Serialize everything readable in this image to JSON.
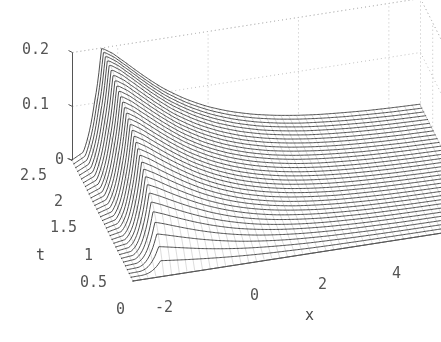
{
  "figure": {
    "kind": "3d-mesh-surface",
    "background": "#ffffff",
    "mesh_color": "#3c3c3c",
    "grid_color": "#bfbfbf",
    "axis_color": "#555555",
    "tick_font_px": 15
  },
  "axes": {
    "x": {
      "label": "x",
      "ticks": [
        "-2",
        "0",
        "2",
        "4"
      ],
      "tick_values": [
        -2,
        0,
        2,
        4
      ],
      "range": [
        -3.0,
        4.7
      ]
    },
    "t": {
      "label": "t",
      "ticks": [
        "0",
        "0.5",
        "1",
        "1.5",
        "2",
        "2.5"
      ],
      "tick_values": [
        0,
        0.5,
        1,
        1.5,
        2,
        2.5
      ],
      "range": [
        0,
        2.5
      ]
    },
    "z": {
      "label": "",
      "ticks": [
        "0",
        "0.1",
        "0.2"
      ],
      "tick_values": [
        0,
        0.1,
        0.2
      ],
      "range": [
        0,
        0.2
      ]
    }
  },
  "chart_data": {
    "type": "line",
    "title": "",
    "xlabel": "x",
    "ylabel": "t",
    "zlabel": "",
    "grid": true,
    "legend": null,
    "xlim": [
      -3.0,
      4.7
    ],
    "ylim": [
      0,
      2.5
    ],
    "zlim": [
      0,
      0.2
    ],
    "xticks": [
      -2,
      0,
      2,
      4
    ],
    "yticks": [
      0,
      0.5,
      1,
      1.5,
      2,
      2.5
    ],
    "zticks": [
      0,
      0.1,
      0.2
    ],
    "surface": {
      "x": [
        -3.0,
        -2.75,
        -2.5,
        -2.3,
        -2.1,
        -1.8,
        -1.4,
        -1.0,
        -0.5,
        0.0,
        0.5,
        1.0,
        1.5,
        2.0,
        2.5,
        3.0,
        3.5,
        4.0,
        4.7
      ],
      "t": [
        0,
        0.078,
        0.156,
        0.234,
        0.313,
        0.391,
        0.469,
        0.547,
        0.625,
        0.703,
        0.781,
        0.859,
        0.938,
        1.016,
        1.094,
        1.172,
        1.25,
        1.328,
        1.406,
        1.484,
        1.563,
        1.641,
        1.719,
        1.797,
        1.875,
        1.953,
        2.031,
        2.109,
        2.188,
        2.266,
        2.344,
        2.422,
        2.5
      ],
      "series": [
        {
          "name": "t=0.000",
          "values": [
            0,
            0,
            0,
            0,
            0,
            0,
            0,
            0,
            0,
            0,
            0,
            0,
            0,
            0,
            0,
            0,
            0,
            0,
            0
          ]
        },
        {
          "name": "t=0.078",
          "values": [
            0,
            0.001,
            0.006,
            0.007,
            0.006,
            0.005,
            0.004,
            0.003,
            0.002,
            0.001,
            0.001,
            0,
            0,
            0,
            0,
            0,
            0,
            0,
            0
          ]
        },
        {
          "name": "t=0.156",
          "values": [
            0,
            0.002,
            0.012,
            0.014,
            0.013,
            0.011,
            0.008,
            0.006,
            0.004,
            0.003,
            0.002,
            0.001,
            0.001,
            0,
            0,
            0,
            0,
            0,
            0
          ]
        },
        {
          "name": "t=0.234",
          "values": [
            0,
            0.003,
            0.018,
            0.021,
            0.02,
            0.017,
            0.013,
            0.01,
            0.007,
            0.005,
            0.003,
            0.002,
            0.001,
            0.001,
            0,
            0,
            0,
            0,
            0
          ]
        },
        {
          "name": "t=0.313",
          "values": [
            0,
            0.004,
            0.024,
            0.028,
            0.027,
            0.023,
            0.018,
            0.014,
            0.01,
            0.007,
            0.005,
            0.003,
            0.002,
            0.001,
            0.001,
            0,
            0,
            0,
            0
          ]
        },
        {
          "name": "t=0.391",
          "values": [
            0,
            0.005,
            0.03,
            0.035,
            0.034,
            0.029,
            0.023,
            0.018,
            0.013,
            0.01,
            0.007,
            0.005,
            0.003,
            0.002,
            0.001,
            0.001,
            0,
            0,
            0
          ]
        },
        {
          "name": "t=0.469",
          "values": [
            0,
            0.006,
            0.036,
            0.042,
            0.041,
            0.035,
            0.028,
            0.022,
            0.017,
            0.012,
            0.009,
            0.006,
            0.004,
            0.003,
            0.002,
            0.001,
            0.001,
            0,
            0
          ]
        },
        {
          "name": "t=0.547",
          "values": [
            0,
            0.007,
            0.042,
            0.049,
            0.048,
            0.042,
            0.034,
            0.027,
            0.02,
            0.015,
            0.011,
            0.008,
            0.005,
            0.004,
            0.002,
            0.002,
            0.001,
            0.001,
            0
          ]
        },
        {
          "name": "t=0.625",
          "values": [
            0,
            0.008,
            0.048,
            0.056,
            0.055,
            0.048,
            0.039,
            0.031,
            0.024,
            0.018,
            0.013,
            0.01,
            0.007,
            0.005,
            0.003,
            0.002,
            0.001,
            0.001,
            0.001
          ]
        },
        {
          "name": "t=0.703",
          "values": [
            0,
            0.009,
            0.054,
            0.063,
            0.062,
            0.054,
            0.044,
            0.035,
            0.027,
            0.021,
            0.016,
            0.012,
            0.008,
            0.006,
            0.004,
            0.003,
            0.002,
            0.001,
            0.001
          ]
        },
        {
          "name": "t=0.781",
          "values": [
            0,
            0.01,
            0.06,
            0.07,
            0.069,
            0.061,
            0.05,
            0.04,
            0.031,
            0.024,
            0.018,
            0.013,
            0.01,
            0.007,
            0.005,
            0.003,
            0.002,
            0.002,
            0.001
          ]
        },
        {
          "name": "t=0.859",
          "values": [
            0,
            0.011,
            0.066,
            0.077,
            0.076,
            0.067,
            0.055,
            0.044,
            0.034,
            0.026,
            0.02,
            0.015,
            0.011,
            0.008,
            0.006,
            0.004,
            0.003,
            0.002,
            0.001
          ]
        },
        {
          "name": "t=0.938",
          "values": [
            0,
            0.012,
            0.072,
            0.084,
            0.083,
            0.073,
            0.061,
            0.049,
            0.038,
            0.029,
            0.022,
            0.017,
            0.013,
            0.009,
            0.007,
            0.005,
            0.003,
            0.002,
            0.001
          ]
        },
        {
          "name": "t=1.016",
          "values": [
            0,
            0.013,
            0.078,
            0.091,
            0.09,
            0.08,
            0.066,
            0.053,
            0.041,
            0.032,
            0.025,
            0.019,
            0.014,
            0.01,
            0.008,
            0.005,
            0.004,
            0.003,
            0.002
          ]
        },
        {
          "name": "t=1.094",
          "values": [
            0,
            0.014,
            0.084,
            0.098,
            0.097,
            0.086,
            0.072,
            0.058,
            0.045,
            0.035,
            0.027,
            0.02,
            0.015,
            0.011,
            0.008,
            0.006,
            0.004,
            0.003,
            0.002
          ]
        },
        {
          "name": "t=1.172",
          "values": [
            0,
            0.015,
            0.09,
            0.105,
            0.104,
            0.093,
            0.077,
            0.063,
            0.049,
            0.038,
            0.029,
            0.022,
            0.017,
            0.012,
            0.009,
            0.007,
            0.005,
            0.003,
            0.002
          ]
        },
        {
          "name": "t=1.250",
          "values": [
            0,
            0.016,
            0.096,
            0.112,
            0.111,
            0.099,
            0.083,
            0.067,
            0.053,
            0.041,
            0.032,
            0.024,
            0.018,
            0.014,
            0.01,
            0.007,
            0.005,
            0.004,
            0.002
          ]
        },
        {
          "name": "t=1.328",
          "values": [
            0,
            0.017,
            0.102,
            0.119,
            0.118,
            0.106,
            0.088,
            0.072,
            0.056,
            0.044,
            0.034,
            0.026,
            0.02,
            0.015,
            0.011,
            0.008,
            0.006,
            0.004,
            0.003
          ]
        },
        {
          "name": "t=1.406",
          "values": [
            0,
            0.018,
            0.108,
            0.126,
            0.125,
            0.112,
            0.094,
            0.076,
            0.06,
            0.047,
            0.036,
            0.028,
            0.021,
            0.016,
            0.012,
            0.009,
            0.006,
            0.004,
            0.003
          ]
        },
        {
          "name": "t=1.484",
          "values": [
            0,
            0.019,
            0.114,
            0.133,
            0.132,
            0.119,
            0.099,
            0.081,
            0.064,
            0.05,
            0.039,
            0.03,
            0.023,
            0.017,
            0.013,
            0.009,
            0.007,
            0.005,
            0.003
          ]
        },
        {
          "name": "t=1.563",
          "values": [
            0,
            0.02,
            0.12,
            0.14,
            0.139,
            0.125,
            0.105,
            0.086,
            0.068,
            0.053,
            0.041,
            0.032,
            0.024,
            0.018,
            0.014,
            0.01,
            0.007,
            0.005,
            0.003
          ]
        },
        {
          "name": "t=1.641",
          "values": [
            0,
            0.021,
            0.126,
            0.147,
            0.146,
            0.132,
            0.111,
            0.09,
            0.071,
            0.056,
            0.044,
            0.034,
            0.026,
            0.02,
            0.015,
            0.011,
            0.008,
            0.006,
            0.004
          ]
        },
        {
          "name": "t=1.719",
          "values": [
            0,
            0.022,
            0.132,
            0.154,
            0.153,
            0.138,
            0.116,
            0.095,
            0.075,
            0.059,
            0.046,
            0.035,
            0.027,
            0.021,
            0.016,
            0.011,
            0.008,
            0.006,
            0.004
          ]
        },
        {
          "name": "t=1.797",
          "values": [
            0,
            0.023,
            0.138,
            0.161,
            0.16,
            0.145,
            0.122,
            0.1,
            0.079,
            0.062,
            0.048,
            0.037,
            0.029,
            0.022,
            0.016,
            0.012,
            0.009,
            0.006,
            0.004
          ]
        },
        {
          "name": "t=1.875",
          "values": [
            0,
            0.024,
            0.144,
            0.168,
            0.167,
            0.151,
            0.127,
            0.104,
            0.083,
            0.065,
            0.051,
            0.039,
            0.03,
            0.023,
            0.017,
            0.013,
            0.009,
            0.007,
            0.004
          ]
        },
        {
          "name": "t=1.953",
          "values": [
            0,
            0.025,
            0.15,
            0.175,
            0.174,
            0.158,
            0.133,
            0.109,
            0.086,
            0.068,
            0.053,
            0.041,
            0.032,
            0.024,
            0.018,
            0.013,
            0.01,
            0.007,
            0.005
          ]
        },
        {
          "name": "t=2.031",
          "values": [
            0,
            0.026,
            0.156,
            0.182,
            0.181,
            0.164,
            0.138,
            0.113,
            0.09,
            0.071,
            0.055,
            0.043,
            0.033,
            0.025,
            0.019,
            0.014,
            0.01,
            0.007,
            0.005
          ]
        },
        {
          "name": "t=2.109",
          "values": [
            0,
            0.027,
            0.162,
            0.189,
            0.188,
            0.171,
            0.144,
            0.118,
            0.094,
            0.074,
            0.058,
            0.045,
            0.035,
            0.026,
            0.02,
            0.015,
            0.011,
            0.008,
            0.005
          ]
        },
        {
          "name": "t=2.188",
          "values": [
            0,
            0.028,
            0.168,
            0.194,
            0.193,
            0.176,
            0.148,
            0.122,
            0.097,
            0.076,
            0.06,
            0.046,
            0.036,
            0.027,
            0.021,
            0.015,
            0.011,
            0.008,
            0.005
          ]
        },
        {
          "name": "t=2.266",
          "values": [
            0,
            0.029,
            0.173,
            0.197,
            0.196,
            0.179,
            0.151,
            0.124,
            0.099,
            0.078,
            0.061,
            0.047,
            0.037,
            0.028,
            0.021,
            0.016,
            0.011,
            0.008,
            0.005
          ]
        },
        {
          "name": "t=2.344",
          "values": [
            0,
            0.03,
            0.177,
            0.199,
            0.198,
            0.181,
            0.153,
            0.126,
            0.1,
            0.079,
            0.062,
            0.048,
            0.037,
            0.028,
            0.022,
            0.016,
            0.012,
            0.008,
            0.005
          ]
        },
        {
          "name": "t=2.422",
          "values": [
            0,
            0.031,
            0.18,
            0.2,
            0.199,
            0.182,
            0.154,
            0.127,
            0.101,
            0.08,
            0.063,
            0.049,
            0.038,
            0.029,
            0.022,
            0.016,
            0.012,
            0.008,
            0.005
          ]
        },
        {
          "name": "t=2.500",
          "values": [
            0,
            0.032,
            0.182,
            0.2,
            0.2,
            0.183,
            0.155,
            0.128,
            0.102,
            0.08,
            0.063,
            0.049,
            0.038,
            0.029,
            0.022,
            0.017,
            0.012,
            0.009,
            0.006
          ]
        }
      ]
    }
  },
  "tick_labels": {
    "z": [
      {
        "text": "0.2",
        "x": 22,
        "y": 42
      },
      {
        "text": "0.1",
        "x": 22,
        "y": 97
      },
      {
        "text": "0",
        "x": 55,
        "y": 152
      }
    ],
    "t": [
      {
        "text": "2.5",
        "x": 20,
        "y": 168
      },
      {
        "text": "2",
        "x": 54,
        "y": 194
      },
      {
        "text": "1.5",
        "x": 50,
        "y": 220
      },
      {
        "text": "1",
        "x": 84,
        "y": 248
      },
      {
        "text": "0.5",
        "x": 80,
        "y": 275
      },
      {
        "text": "0",
        "x": 116,
        "y": 302
      }
    ],
    "x": [
      {
        "text": "-2",
        "x": 155,
        "y": 300
      },
      {
        "text": "0",
        "x": 250,
        "y": 288
      },
      {
        "text": "2",
        "x": 318,
        "y": 277
      },
      {
        "text": "4",
        "x": 392,
        "y": 266
      }
    ]
  },
  "axis_titles": [
    {
      "name": "t",
      "text": "t",
      "x": 36,
      "y": 248
    },
    {
      "name": "x",
      "text": "x",
      "x": 305,
      "y": 308
    }
  ]
}
